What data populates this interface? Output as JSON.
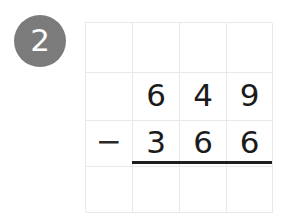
{
  "badge": {
    "icon": "circle-badge-icon",
    "number": "2",
    "background_color": "#7b7b7b",
    "text_color": "#ffffff"
  },
  "worksheet": {
    "type": "vertical-subtraction",
    "grid": {
      "columns": 4,
      "rows": 4,
      "line_color": "#e9e9e9"
    },
    "rows": [
      {
        "name": "empty-top-row",
        "cells": [
          "",
          "",
          "",
          ""
        ]
      },
      {
        "name": "minuend-row",
        "cells": [
          "",
          "6",
          "4",
          "9"
        ]
      },
      {
        "name": "subtrahend-row",
        "cells": [
          "−",
          "3",
          "6",
          "6"
        ]
      },
      {
        "name": "answer-row",
        "cells": [
          "",
          "",
          "",
          ""
        ]
      }
    ],
    "rule": {
      "name": "answer-rule",
      "color": "#1e1e1e"
    }
  },
  "problem": {
    "minuend": "649",
    "operator": "−",
    "subtrahend": "366",
    "answer": ""
  }
}
